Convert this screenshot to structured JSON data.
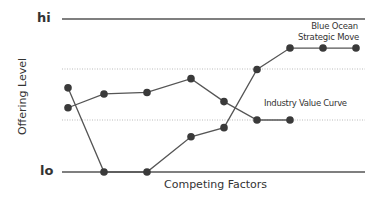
{
  "chart_data": {
    "type": "line",
    "title": "",
    "xlabel": "Competing Factors",
    "ylabel": "Offering Level",
    "y_tick_labels": [
      "lo",
      "hi"
    ],
    "ylim": [
      0,
      10
    ],
    "grid": "dotted horizontal at ~3.4 and ~6.7",
    "x": [
      1,
      2,
      3,
      4,
      5,
      6,
      7,
      8,
      9
    ],
    "series": [
      {
        "name": "Industry Value Curve",
        "values": [
          4.2,
          5.1,
          5.2,
          6.1,
          4.6,
          3.4,
          3.4,
          null,
          null
        ]
      },
      {
        "name": "Blue Ocean Strategic Move",
        "values": [
          5.5,
          0,
          0,
          2.3,
          2.9,
          6.7,
          8.1,
          8.1,
          8.1
        ]
      }
    ],
    "annotations": [
      {
        "text": "Blue Ocean Strategic Move",
        "near_series": "Blue Ocean Strategic Move"
      },
      {
        "text": "Industry Value Curve",
        "near_series": "Industry Value Curve"
      }
    ],
    "legend": "inline annotations"
  },
  "labels": {
    "hi": "hi",
    "lo": "lo",
    "ylabel": "Offering Level",
    "xlabel": "Competing Factors",
    "blue_ocean_line1": "Blue Ocean",
    "blue_ocean_line2": "Strategic Move",
    "industry": "Industry Value Curve"
  },
  "colors": {
    "line": "#555555",
    "point": "#3a3a3a",
    "axis": "#555555",
    "grid": "#bbbbbb"
  }
}
